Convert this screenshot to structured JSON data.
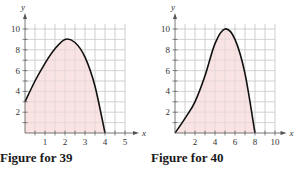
{
  "figures": [
    {
      "caption": "Figure for 39",
      "x_label": "x",
      "y_label": "y",
      "x_ticks": [
        "1",
        "2",
        "3",
        "4",
        "5"
      ],
      "y_ticks": [
        "2",
        "4",
        "6",
        "8",
        "10"
      ]
    },
    {
      "caption": "Figure for 40",
      "x_label": "x",
      "y_label": "y",
      "x_ticks": [
        "2",
        "4",
        "6",
        "8",
        "10"
      ],
      "y_ticks": [
        "2",
        "4",
        "6",
        "8",
        "10"
      ]
    }
  ],
  "colors": {
    "fill": "#f9e3e3",
    "grid": "#c8c8c8",
    "curve": "#111111",
    "axis": "#555555"
  },
  "chart_data": [
    {
      "type": "area",
      "title": "Figure for 39",
      "xlabel": "x",
      "ylabel": "y",
      "xlim": [
        0,
        5
      ],
      "ylim": [
        0,
        10
      ],
      "grid": true,
      "x_tick_labels": [
        1,
        2,
        3,
        4,
        5
      ],
      "y_tick_labels": [
        2,
        4,
        6,
        8,
        10
      ],
      "series": [
        {
          "name": "curve",
          "x": [
            0,
            0.5,
            1,
            1.5,
            2,
            2.5,
            3,
            3.5,
            4
          ],
          "values": [
            3,
            5,
            6.7,
            8.1,
            9,
            8.7,
            7.3,
            4.5,
            0
          ]
        }
      ],
      "shaded_region": "area under curve from x=0 to x=4"
    },
    {
      "type": "area",
      "title": "Figure for 40",
      "xlabel": "x",
      "ylabel": "y",
      "xlim": [
        0,
        10
      ],
      "ylim": [
        0,
        10
      ],
      "grid": true,
      "x_tick_labels": [
        2,
        4,
        6,
        8,
        10
      ],
      "y_tick_labels": [
        2,
        4,
        6,
        8,
        10
      ],
      "series": [
        {
          "name": "curve",
          "x": [
            0,
            1,
            2,
            3,
            4,
            5,
            6,
            7,
            8
          ],
          "values": [
            0,
            1.4,
            3,
            5.5,
            8.6,
            10,
            9,
            5.7,
            0
          ]
        }
      ],
      "shaded_region": "area under curve from x=0 to x=8"
    }
  ]
}
